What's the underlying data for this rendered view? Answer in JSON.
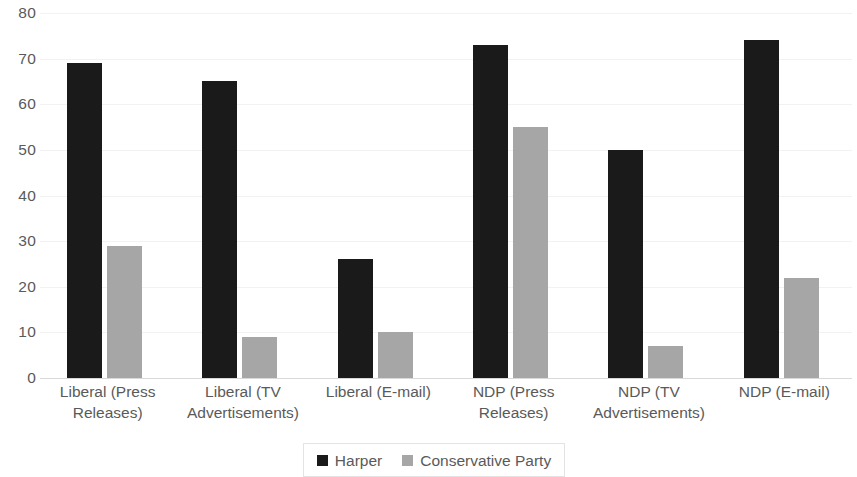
{
  "chart_data": {
    "type": "bar",
    "title": "",
    "subtitle": "",
    "xlabel": "",
    "ylabel": "",
    "ylim": [
      0,
      80
    ],
    "ytick_step": 10,
    "yticks": [
      80,
      70,
      60,
      50,
      40,
      30,
      20,
      10,
      0
    ],
    "grid": true,
    "grid_axis": "y",
    "legend_position": "bottom",
    "categories": [
      "Liberal (Press Releases)",
      "Liberal (TV Advertisements)",
      "Liberal (E-mail)",
      "NDP (Press Releases)",
      "NDP (TV Advertisements)",
      "NDP (E-mail)"
    ],
    "series": [
      {
        "name": "Harper",
        "color": "#1A1A1A",
        "values": [
          69,
          65,
          26,
          73,
          50,
          74
        ]
      },
      {
        "name": "Conservative Party",
        "color": "#A6A6A6",
        "values": [
          29,
          9,
          10,
          55,
          7,
          22
        ]
      }
    ]
  },
  "legend": {
    "items": [
      {
        "label": "Harper",
        "color": "#1A1A1A"
      },
      {
        "label": "Conservative Party",
        "color": "#A6A6A6"
      }
    ]
  }
}
